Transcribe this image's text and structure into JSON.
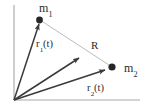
{
  "figure": {
    "name": "two-body-position-vectors",
    "caption": "Position vectors of two masses relative to an origin and their separation vector",
    "background_color": "#ffffff",
    "axis_color": "#a8a8a8",
    "vector_color": "#3a3a3a",
    "connector_color": "#b4b4b4",
    "marker_color": "#262626"
  },
  "labels": {
    "m1": {
      "base": "m",
      "subscript": "1"
    },
    "m2": {
      "base": "m",
      "subscript": "2"
    },
    "r1": {
      "base": "r",
      "subscript": "1",
      "suffix": "(t)"
    },
    "r2": {
      "base": "r",
      "subscript": "2",
      "suffix": "(t)"
    },
    "R": {
      "base": "R"
    }
  },
  "geometry": {
    "origin": {
      "x": 14,
      "y": 100
    },
    "axis_vertical_top": {
      "x": 14,
      "y": 5
    },
    "axis_horizontal_right": {
      "x": 140,
      "y": 100
    },
    "mass1_point": {
      "x": 39,
      "y": 20
    },
    "mass2_point": {
      "x": 112,
      "y": 67
    },
    "r1_vector": {
      "from": {
        "x": 14,
        "y": 100
      },
      "to": {
        "x": 39,
        "y": 22
      }
    },
    "r2_vector": {
      "from": {
        "x": 14,
        "y": 100
      },
      "to": {
        "x": 108,
        "y": 69
      }
    },
    "R_vector": {
      "from": {
        "x": 14,
        "y": 100
      },
      "to": {
        "x": 82,
        "y": 56
      }
    },
    "connector_line": {
      "from": {
        "x": 40,
        "y": 20
      },
      "to": {
        "x": 112,
        "y": 67
      }
    }
  }
}
